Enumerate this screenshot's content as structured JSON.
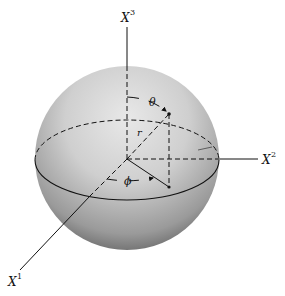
{
  "figure": {
    "axes": {
      "x1": {
        "base": "X",
        "sup": "1"
      },
      "x2": {
        "base": "X",
        "sup": "2"
      },
      "x3": {
        "base": "X",
        "sup": "3"
      }
    },
    "symbols": {
      "theta": "θ",
      "phi": "ϕ",
      "r": "r"
    },
    "colors": {
      "highlight": "#e6e6e6",
      "mid": "#bdbdbd",
      "shadow": "#5e5e5e",
      "line": "#111111"
    }
  }
}
